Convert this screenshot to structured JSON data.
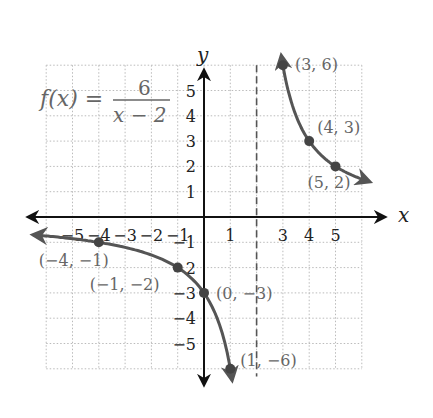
{
  "chart_data": {
    "type": "line",
    "equation": {
      "lhs": "f(x) =",
      "numerator": "6",
      "denominator": "x − 2"
    },
    "xlabel": "x",
    "ylabel": "y",
    "xlim": [
      -6,
      6
    ],
    "ylim": [
      -6,
      6
    ],
    "grid": true,
    "x_tick_labels": [
      "−5",
      "−4",
      "−3",
      "−2",
      "−1",
      "1",
      "3",
      "4",
      "5"
    ],
    "x_ticks": [
      -5,
      -4,
      -3,
      -2,
      -1,
      1,
      3,
      4,
      5
    ],
    "y_tick_labels": [
      "5",
      "4",
      "3",
      "2",
      "1",
      "−1",
      "2",
      "−3",
      "−4",
      "−5"
    ],
    "y_ticks": [
      5,
      4,
      3,
      2,
      1,
      -1,
      -2,
      -3,
      -4,
      -5
    ],
    "vertical_asymptote": {
      "x": 2,
      "style": "dashed"
    },
    "series": [
      {
        "name": "right branch",
        "function": "6/(x-2)",
        "x_range": [
          3,
          6.0
        ],
        "arrows": "both"
      },
      {
        "name": "left branch",
        "function": "6/(x-2)",
        "x_range": [
          -6.3,
          1.0
        ],
        "arrows": "both"
      }
    ],
    "points": [
      {
        "x": 3,
        "y": 6,
        "label": "(3, 6)"
      },
      {
        "x": 4,
        "y": 3,
        "label": "(4, 3)"
      },
      {
        "x": 5,
        "y": 2,
        "label": "(5, 2)"
      },
      {
        "x": -4,
        "y": -1,
        "label": "(−4, −1)"
      },
      {
        "x": -1,
        "y": -2,
        "label": "(−1, −2)"
      },
      {
        "x": 0,
        "y": -3,
        "label": "(0, −3)"
      },
      {
        "x": 1,
        "y": -6,
        "label": "(1, −6)"
      }
    ],
    "colors": {
      "curve": "#555555",
      "axis": "#111111",
      "grid": "#bbbbbb",
      "text": "#666666"
    }
  }
}
